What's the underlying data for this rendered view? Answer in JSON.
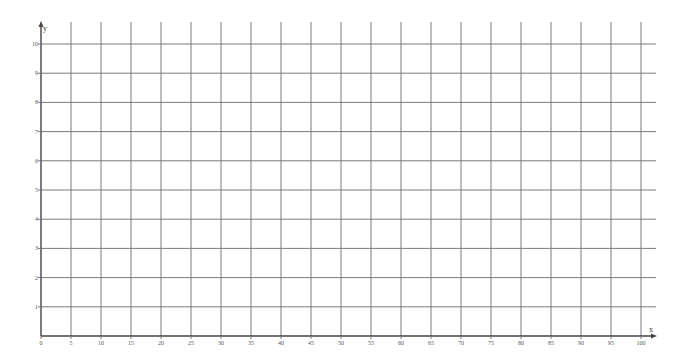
{
  "chart_data": {
    "type": "line",
    "title": "",
    "xlabel": "x",
    "ylabel": "y",
    "xlim": [
      0,
      100
    ],
    "ylim": [
      0,
      10
    ],
    "x_ticks": [
      0,
      5,
      10,
      15,
      20,
      25,
      30,
      35,
      40,
      45,
      50,
      55,
      60,
      65,
      70,
      75,
      80,
      85,
      90,
      95,
      100
    ],
    "x_tick_labels": [
      "0",
      "5",
      "10",
      "15",
      "20",
      "25",
      "30",
      "35",
      "40",
      "45",
      "50",
      "55",
      "60",
      "65",
      "70",
      "75",
      "80",
      "85",
      "90",
      "95",
      "100"
    ],
    "y_ticks": [
      1,
      2,
      3,
      4,
      5,
      6,
      7,
      8,
      9,
      10
    ],
    "y_tick_labels": [
      "1",
      "2",
      "3",
      "4",
      "5",
      "6",
      "7",
      "8",
      "9",
      "10"
    ],
    "grid": true,
    "series": [],
    "legend": "none"
  },
  "colors": {
    "grid": "#7a7a7a",
    "axis": "#444444",
    "background": "#ffffff"
  }
}
